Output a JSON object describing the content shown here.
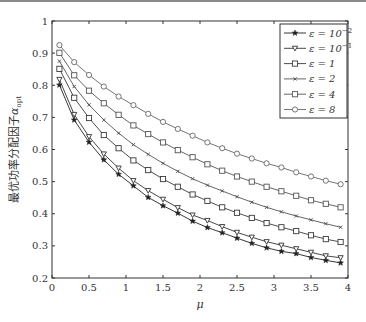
{
  "chart_data": {
    "type": "line",
    "title": "",
    "xlabel": "μ",
    "ylabel": "最优功率分配因子α_opt",
    "ylabel_main": "最优功率分配因子",
    "ylabel_symbol": "α",
    "ylabel_sub": "opt",
    "xlim": [
      0,
      4
    ],
    "ylim": [
      0.2,
      1
    ],
    "xticks": [
      0,
      0.5,
      1,
      1.5,
      2,
      2.5,
      3,
      3.5,
      4
    ],
    "xtick_labels": [
      "0",
      "0.5",
      "1",
      "1.5",
      "2",
      "2.5",
      "3",
      "3.5",
      "4"
    ],
    "yticks": [
      0.2,
      0.3,
      0.4,
      0.5,
      0.6,
      0.7,
      0.8,
      0.9,
      1
    ],
    "ytick_labels": [
      "0.2",
      "0.3",
      "0.4",
      "0.5",
      "0.6",
      "0.7",
      "0.8",
      "0.9",
      "1"
    ],
    "grid": false,
    "legend_position": "upper right",
    "x": [
      0.1,
      0.3,
      0.5,
      0.7,
      0.9,
      1.1,
      1.3,
      1.5,
      1.7,
      1.9,
      2.1,
      2.3,
      2.5,
      2.7,
      2.9,
      3.1,
      3.3,
      3.5,
      3.7,
      3.9
    ],
    "series": [
      {
        "name": "ε = 10^-2",
        "legend_base": "ε = 10",
        "legend_exp": "−2",
        "marker": "star",
        "color": "#222222",
        "values": [
          0.801,
          0.692,
          0.623,
          0.568,
          0.523,
          0.487,
          0.451,
          0.425,
          0.402,
          0.377,
          0.357,
          0.341,
          0.324,
          0.308,
          0.294,
          0.283,
          0.276,
          0.264,
          0.255,
          0.247
        ]
      },
      {
        "name": "ε = 10^-1",
        "legend_base": "ε = 10",
        "legend_exp": "−1",
        "marker": "triangle-down",
        "color": "#333333",
        "values": [
          0.818,
          0.709,
          0.64,
          0.586,
          0.542,
          0.503,
          0.472,
          0.445,
          0.419,
          0.396,
          0.379,
          0.36,
          0.342,
          0.327,
          0.313,
          0.302,
          0.291,
          0.28,
          0.269,
          0.263
        ]
      },
      {
        "name": "ε = 1",
        "legend_base": "ε = 1",
        "legend_exp": "",
        "marker": "square",
        "color": "#3a3a3a",
        "values": [
          0.851,
          0.761,
          0.698,
          0.645,
          0.604,
          0.566,
          0.536,
          0.508,
          0.484,
          0.46,
          0.44,
          0.42,
          0.403,
          0.387,
          0.371,
          0.358,
          0.346,
          0.333,
          0.321,
          0.312
        ]
      },
      {
        "name": "ε = 2",
        "legend_base": "ε = 2",
        "legend_exp": "",
        "marker": "x",
        "color": "#555555",
        "values": [
          0.875,
          0.796,
          0.739,
          0.692,
          0.651,
          0.615,
          0.585,
          0.557,
          0.532,
          0.509,
          0.489,
          0.471,
          0.453,
          0.436,
          0.42,
          0.406,
          0.393,
          0.381,
          0.369,
          0.358
        ]
      },
      {
        "name": "ε = 4",
        "legend_base": "ε = 4",
        "legend_exp": "",
        "marker": "square",
        "color": "#555555",
        "values": [
          0.901,
          0.831,
          0.783,
          0.744,
          0.708,
          0.675,
          0.648,
          0.622,
          0.598,
          0.576,
          0.554,
          0.534,
          0.516,
          0.5,
          0.484,
          0.47,
          0.456,
          0.442,
          0.431,
          0.42
        ]
      },
      {
        "name": "ε = 8",
        "legend_base": "ε = 8",
        "legend_exp": "",
        "marker": "circle",
        "color": "#666666",
        "values": [
          0.925,
          0.872,
          0.832,
          0.796,
          0.765,
          0.738,
          0.711,
          0.686,
          0.664,
          0.643,
          0.622,
          0.604,
          0.587,
          0.572,
          0.557,
          0.544,
          0.529,
          0.516,
          0.503,
          0.492
        ]
      }
    ]
  }
}
